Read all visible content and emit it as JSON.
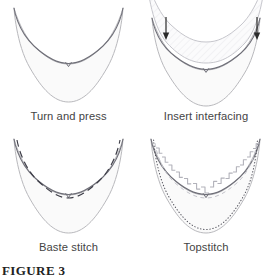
{
  "figure": {
    "label": "FIGURE 3",
    "panel_count": 4,
    "layout": "2x2 grid"
  },
  "colors": {
    "background": "#ffffff",
    "fabric_fill": "#fafafa",
    "fabric_outline": "#b9b9bd",
    "neckline_stroke": "#6f6f78",
    "stitch_dash": "#3c3c46",
    "interfacing_hatch": "#d8d8de",
    "arrow": "#2b2b2b",
    "caption_text": "#444444",
    "figure_label_text": "#222222"
  },
  "panels": [
    {
      "id": "turn-and-press",
      "index": 1,
      "caption": "Turn and press",
      "elements": [
        "collar-body",
        "neckline-edge",
        "center-notch"
      ]
    },
    {
      "id": "insert-interfacing",
      "index": 2,
      "caption": "Insert interfacing",
      "elements": [
        "collar-body",
        "interfacing-layer",
        "interfacing-hatch",
        "neckline-edge",
        "center-notch",
        "arrow-left",
        "arrow-right"
      ],
      "arrows": [
        {
          "name": "arrow-left",
          "direction": "down",
          "x": 62,
          "y_top": 18,
          "y_bottom": 40
        },
        {
          "name": "arrow-right",
          "direction": "down",
          "x": 126,
          "y_top": 18,
          "y_bottom": 40
        }
      ]
    },
    {
      "id": "baste-stitch",
      "index": 3,
      "caption": "Baste stitch",
      "elements": [
        "collar-body",
        "neckline-edge",
        "center-notch",
        "baste-dashed-line"
      ],
      "stitch_style": "long dashes following the neckline"
    },
    {
      "id": "topstitch",
      "index": 4,
      "caption": "Topstitch",
      "elements": [
        "collar-body",
        "neckline-edge",
        "center-notch",
        "topstitch-dotted-outline",
        "understitch-bracket-row"
      ],
      "stitch_style": "fine dotted line around full outer edge plus bracketed understitching at neckline"
    }
  ]
}
